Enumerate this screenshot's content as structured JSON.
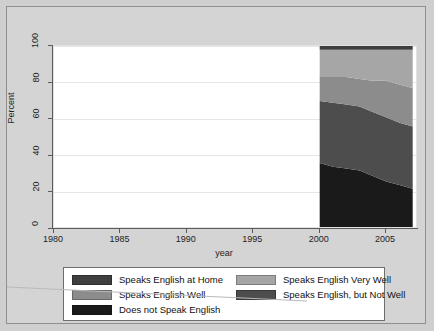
{
  "chart_data": {
    "type": "area",
    "title": "",
    "xlabel": "year",
    "ylabel": "Percent",
    "xlim": [
      1980,
      2007.4
    ],
    "ylim": [
      0,
      100
    ],
    "grid": true,
    "stacked": true,
    "legend_position": "bottom",
    "xticks": [
      "1980",
      "1985",
      "1990",
      "1995",
      "2000",
      "2005"
    ],
    "xtick_values": [
      1980,
      1985,
      1990,
      1995,
      2000,
      2005
    ],
    "yticks": [
      "0",
      "20",
      "40",
      "60",
      "80",
      "100"
    ],
    "ytick_values": [
      0,
      20,
      40,
      60,
      80,
      100
    ],
    "x": [
      2000,
      2001,
      2002,
      2003,
      2004,
      2005,
      2006,
      2007
    ],
    "series": [
      {
        "name": "Does not Speak English",
        "color": "#1a1a1a",
        "values": [
          36,
          34,
          33,
          32,
          29,
          26,
          24,
          22
        ]
      },
      {
        "name": "Speaks English, but Not Well",
        "color": "#4d4d4d",
        "values": [
          34,
          35,
          35,
          35,
          35,
          35,
          34,
          34
        ]
      },
      {
        "name": "Speaks English Well",
        "color": "#8c8c8c",
        "values": [
          13,
          14,
          15,
          15,
          17,
          20,
          21,
          21
        ]
      },
      {
        "name": "Speaks English Very Well",
        "color": "#a6a6a6",
        "values": [
          15,
          15,
          15,
          16,
          17,
          17,
          19,
          21
        ]
      },
      {
        "name": "Speaks English at Home",
        "color": "#3f3f3f",
        "values": [
          2,
          2,
          2,
          2,
          2,
          2,
          2,
          2
        ]
      }
    ]
  },
  "legend": {
    "entries": [
      {
        "label": "Speaks English at Home",
        "color": "#3f3f3f"
      },
      {
        "label": "Speaks English Very Well",
        "color": "#a6a6a6"
      },
      {
        "label": "Speaks English Well",
        "color": "#8c8c8c"
      },
      {
        "label": "Speaks English, but Not Well",
        "color": "#4d4d4d"
      },
      {
        "label": "Does not Speak English",
        "color": "#1a1a1a"
      }
    ]
  }
}
